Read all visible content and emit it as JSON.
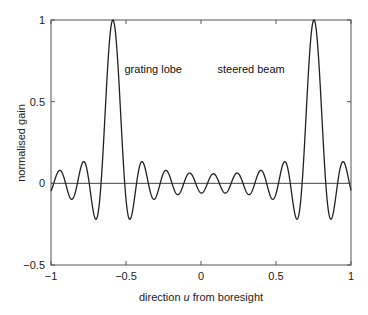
{
  "chart_data": {
    "type": "line",
    "title": "",
    "xlabel_prefix": "direction ",
    "xlabel_var": "u",
    "xlabel_suffix": " from boresight",
    "ylabel": "normalised gain",
    "xlim": [
      -1,
      1
    ],
    "ylim": [
      -0.5,
      1
    ],
    "xticks": [
      -1,
      -0.5,
      0,
      0.5,
      1
    ],
    "xtick_labels": [
      "−1",
      "−0.5",
      "0",
      "0.5",
      "1"
    ],
    "yticks": [
      -0.5,
      0,
      0.5,
      1
    ],
    "ytick_labels": [
      "−0.5",
      "0",
      "0.5",
      "1"
    ],
    "grid": false,
    "zero_line": true,
    "model": {
      "description": "uniform linear array factor sin(N psi/2)/(N sin(psi/2)), psi = 2*pi*(d/lambda)*(u - u0)",
      "N": 17,
      "d_over_lambda": 0.746,
      "u0": 0.753
    },
    "key_points": [
      {
        "u": -0.587,
        "gain": 1.0,
        "label": "grating lobe peak"
      },
      {
        "u": 0.753,
        "gain": 1.0,
        "label": "steered beam peak"
      },
      {
        "u": -0.69,
        "gain": -0.22
      },
      {
        "u": -0.49,
        "gain": -0.22
      },
      {
        "u": 0.65,
        "gain": -0.22
      },
      {
        "u": 0.86,
        "gain": -0.22
      },
      {
        "u": -1.0,
        "gain": -0.05
      },
      {
        "u": 1.0,
        "gain": -0.04
      }
    ],
    "annotations": [
      {
        "text": "grating lobe",
        "u": -0.51,
        "gain": 0.7
      },
      {
        "text": "steered beam",
        "u": 0.11,
        "gain": 0.7
      }
    ],
    "line_color": "#222222"
  }
}
